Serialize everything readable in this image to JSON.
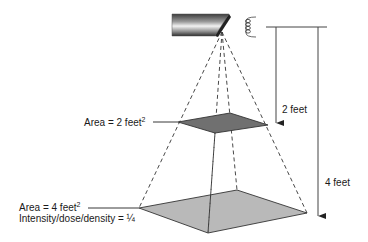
{
  "diagram": {
    "type": "inverse-square-law-illustration",
    "labels": {
      "near_area": "Area = 2 feet",
      "near_area_sup": "2",
      "far_area": "Area = 4 feet",
      "far_area_sup": "2",
      "far_intensity": "Intensity/dose/density = ¼",
      "near_distance": "2 feet",
      "far_distance": "4 feet"
    },
    "colors": {
      "near_plane": "#6e6e6e",
      "far_plane": "#b8b8b8",
      "outline": "#333333",
      "tube_dark": "#4a4a4a",
      "tube_light": "#e8e8e8"
    },
    "elements": [
      "x-ray-tube",
      "filament-coil",
      "beam-divergence-lines",
      "near-plane-square",
      "far-plane-square",
      "distance-arrow-2ft",
      "distance-arrow-4ft"
    ]
  }
}
